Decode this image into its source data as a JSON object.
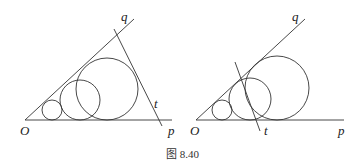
{
  "figure": {
    "caption": "图 8.40",
    "left": {
      "labels": {
        "O": "O",
        "p": "p",
        "q": "q",
        "t": "t"
      },
      "circles": [
        {
          "cx": 52,
          "cy": 110,
          "r": 10
        },
        {
          "cx": 80,
          "cy": 100,
          "r": 20
        },
        {
          "cx": 107,
          "cy": 89,
          "r": 31
        }
      ]
    },
    "right": {
      "labels": {
        "O": "O",
        "p": "p",
        "q": "q",
        "t": "t"
      },
      "circles": [
        {
          "cx": 222,
          "cy": 110,
          "r": 10
        },
        {
          "cx": 250,
          "cy": 99,
          "r": 21
        },
        {
          "cx": 277,
          "cy": 88,
          "r": 32
        }
      ]
    }
  }
}
